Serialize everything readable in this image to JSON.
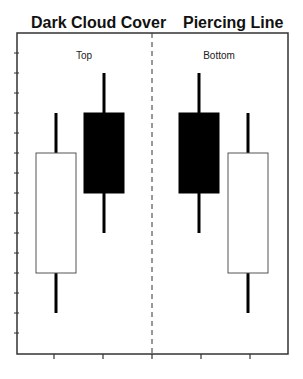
{
  "titles": {
    "left": "Dark Cloud Cover",
    "right": "Piercing Line"
  },
  "labels": {
    "left": "Top",
    "right": "Bottom"
  },
  "colors": {
    "bullish_fill": "#ffffff",
    "bearish_fill": "#000000",
    "axis": "#333333",
    "wick": "#000000"
  },
  "chart_data": {
    "type": "candlestick",
    "title": "",
    "panels": [
      {
        "title": "Dark Cloud Cover",
        "annotation": "Top"
      },
      {
        "title": "Piercing Line",
        "annotation": "Bottom"
      }
    ],
    "categories": [
      1,
      2,
      3,
      4
    ],
    "series": [
      {
        "name": "Dark Cloud Cover day 1",
        "open": 4,
        "high": 12,
        "low": 2,
        "close": 10
      },
      {
        "name": "Dark Cloud Cover day 2",
        "open": 12,
        "high": 14,
        "low": 6,
        "close": 8
      },
      {
        "name": "Piercing Line day 1",
        "open": 12,
        "high": 14,
        "low": 6,
        "close": 8
      },
      {
        "name": "Piercing Line day 2",
        "open": 4,
        "high": 12,
        "low": 2,
        "close": 10
      }
    ],
    "xlabel": "",
    "ylabel": "",
    "ylim": [
      0,
      16
    ],
    "y_ticks": 15,
    "x_ticks": 5,
    "grid": false,
    "legend": "none",
    "divider": "dashed vertical line between panels"
  }
}
